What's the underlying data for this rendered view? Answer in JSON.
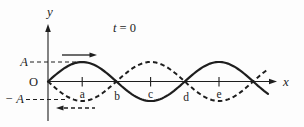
{
  "figure": {
    "time_var": "t",
    "time_rest": " = 0",
    "y_axis_label": "y",
    "x_axis_label": "x",
    "origin_label": "O",
    "amplitude_top_label": "A",
    "amplitude_bottom_label": "− A",
    "tick_labels": [
      "a",
      "b",
      "c",
      "d",
      "e"
    ],
    "colors": {
      "ink": "#1e1e1e",
      "background": "#fdfdfd"
    }
  },
  "wave": {
    "type": "sine",
    "origin_x": 48,
    "axis_y": 81.5,
    "amplitude_px": 19.5,
    "half_wavelength_px": 68.4,
    "end_x": 268,
    "solid_wave": {
      "phase": "starts-upward",
      "direction_of_travel": "right"
    },
    "dashed_wave": {
      "phase": "starts-downward",
      "direction_of_travel": "left"
    },
    "extremum_tick_labels": [
      "a",
      "c",
      "e"
    ],
    "zero_crossing_labels": [
      "b",
      "d"
    ]
  }
}
